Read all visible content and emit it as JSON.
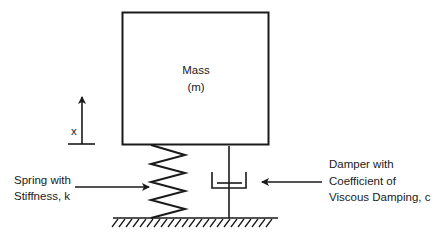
{
  "diagram": {
    "mass": {
      "label_line1": "Mass",
      "label_line2": "(m)"
    },
    "displacement": {
      "label": "x"
    },
    "spring": {
      "label_line1": "Spring with",
      "label_line2": "Stiffness, k"
    },
    "damper": {
      "label_line1": "Damper with",
      "label_line2": "Coefficient of",
      "label_line3": "Viscous Damping, c"
    },
    "ground": {
      "label": ""
    },
    "colors": {
      "stroke": "#1a1a1a",
      "background": "#ffffff"
    }
  }
}
